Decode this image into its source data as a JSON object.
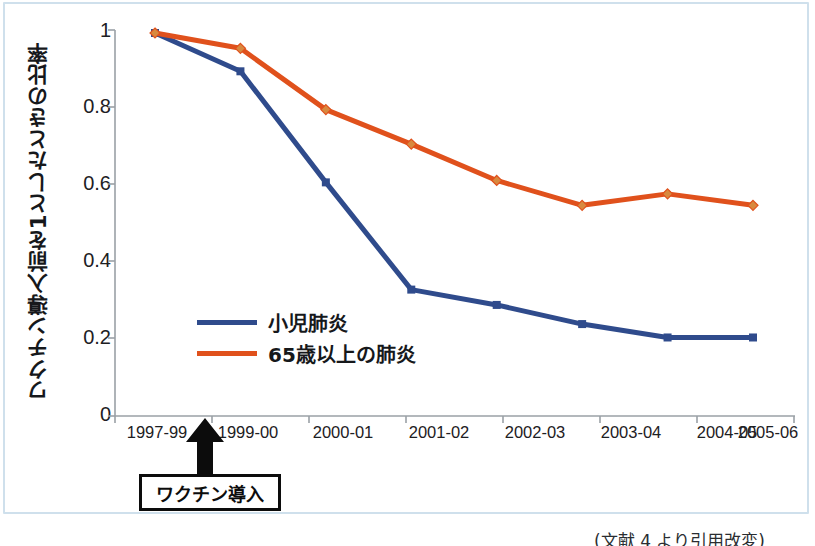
{
  "chart_data": {
    "type": "line",
    "title": "",
    "xlabel": "",
    "ylabel": "ワクチン導入前を1としたときの比率",
    "categories": [
      "1997-99",
      "1999-00",
      "2000-01",
      "2001-02",
      "2002-03",
      "2003-04",
      "2004-05",
      "2005-06"
    ],
    "series": [
      {
        "name": "小児肺炎",
        "color": "#2f4b8c",
        "marker": "square",
        "values": [
          1.0,
          0.9,
          0.61,
          0.33,
          0.29,
          0.24,
          0.205,
          0.205
        ]
      },
      {
        "name": "65歳以上の肺炎",
        "color": "#e0511c",
        "marker": "diamond",
        "values": [
          1.0,
          0.96,
          0.8,
          0.71,
          0.615,
          0.55,
          0.58,
          0.55
        ]
      }
    ],
    "ylim": [
      0,
      1
    ],
    "yticks": [
      "0",
      "0.2",
      "0.4",
      "0.6",
      "0.8",
      "1"
    ],
    "ytick_values": [
      0,
      0.2,
      0.4,
      0.6,
      0.8,
      1
    ],
    "grid": false,
    "legend_position": "inside-lower-left",
    "annotations": [
      {
        "label": "ワクチン導入",
        "at_category": "1999-00",
        "style": "boxed-arrow-up"
      }
    ]
  },
  "axis": {
    "y_title": "ワクチン導入前を1としたときの比率",
    "y_tick_labels": [
      "1",
      "0.8",
      "0.6",
      "0.4",
      "0.2",
      "0"
    ],
    "x_tick_labels": [
      "1997-99",
      "1999-00",
      "2000-01",
      "2001-02",
      "2002-03",
      "2003-04",
      "2004-05",
      "2005-06"
    ],
    "axis_color": "#9aa0a6"
  },
  "legend": {
    "items": [
      {
        "label": "小児肺炎",
        "color": "#2f4b8c"
      },
      {
        "label": "65歳以上の肺炎",
        "color": "#e0511c"
      }
    ]
  },
  "annotation": {
    "label": "ワクチン導入"
  },
  "footer": {
    "source_credit": "(文献 4 より引用改変)"
  },
  "colors": {
    "series_blue": "#2f4b8c",
    "series_orange": "#e0511c",
    "frame_border": "#cfe0ec",
    "text": "#16181b",
    "axis": "#9aa0a6"
  }
}
